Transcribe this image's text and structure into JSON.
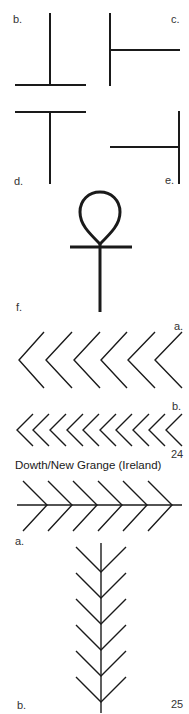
{
  "figure_labels": {
    "b_top": "b.",
    "c": "c.",
    "d": "d.",
    "e": "e.",
    "f": "f.",
    "a_chevrons": "a.",
    "b_chevrons": "b.",
    "a_herringbone": "a.",
    "b_tree": "b."
  },
  "figure_numbers": {
    "fig24": "24",
    "fig25": "25"
  },
  "caption": "Dowth/New Grange (Ireland)",
  "colors": {
    "ink": "#1a1a1a",
    "background": "#ffffff"
  },
  "symbols": [
    "inverted-t-sign",
    "right-t-sign",
    "t-sign",
    "left-t-sign",
    "ankh-sign",
    "chevron-row-large",
    "chevron-row-small",
    "horizontal-herringbone",
    "vertical-tree"
  ]
}
